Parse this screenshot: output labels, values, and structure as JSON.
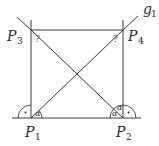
{
  "diagram": {
    "points": {
      "p1": {
        "name": "P",
        "sub": "1"
      },
      "p2": {
        "name": "P",
        "sub": "2"
      },
      "p3": {
        "name": "P",
        "sub": "3"
      },
      "p4": {
        "name": "P",
        "sub": "4"
      }
    },
    "line_label": {
      "name": "g",
      "sub": "1"
    },
    "unknown_angles": [
      "?",
      "?"
    ],
    "angles": {
      "p1_alpha": "α",
      "p2_alpha_lower": "α",
      "p2_alpha_upper": "α"
    },
    "right_angle_marker": "·"
  }
}
